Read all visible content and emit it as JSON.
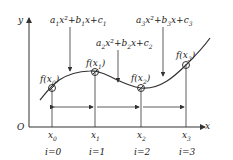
{
  "axes": {
    "y_label": "y",
    "x_label": "x",
    "origin_label": "O"
  },
  "polynomials": [
    {
      "a": "a",
      "i": "1",
      "text": "a1x²+b1x+c1"
    },
    {
      "a": "a",
      "i": "2",
      "text": "a2x²+b2x+c2"
    },
    {
      "a": "a",
      "i": "3",
      "text": "a3x²+b3x+c3"
    }
  ],
  "points": [
    {
      "f": "f(x0)",
      "x": "x",
      "sub": "0",
      "index": "i=0"
    },
    {
      "f": "f(x1)",
      "x": "x",
      "sub": "1",
      "index": "i=1"
    },
    {
      "f": "f(x2)",
      "x": "x",
      "sub": "2",
      "index": "i=2"
    },
    {
      "f": "f(x3)",
      "x": "x",
      "sub": "3",
      "index": "i=3"
    }
  ],
  "colors": {
    "stroke": "#333333",
    "background": "#ffffff"
  }
}
